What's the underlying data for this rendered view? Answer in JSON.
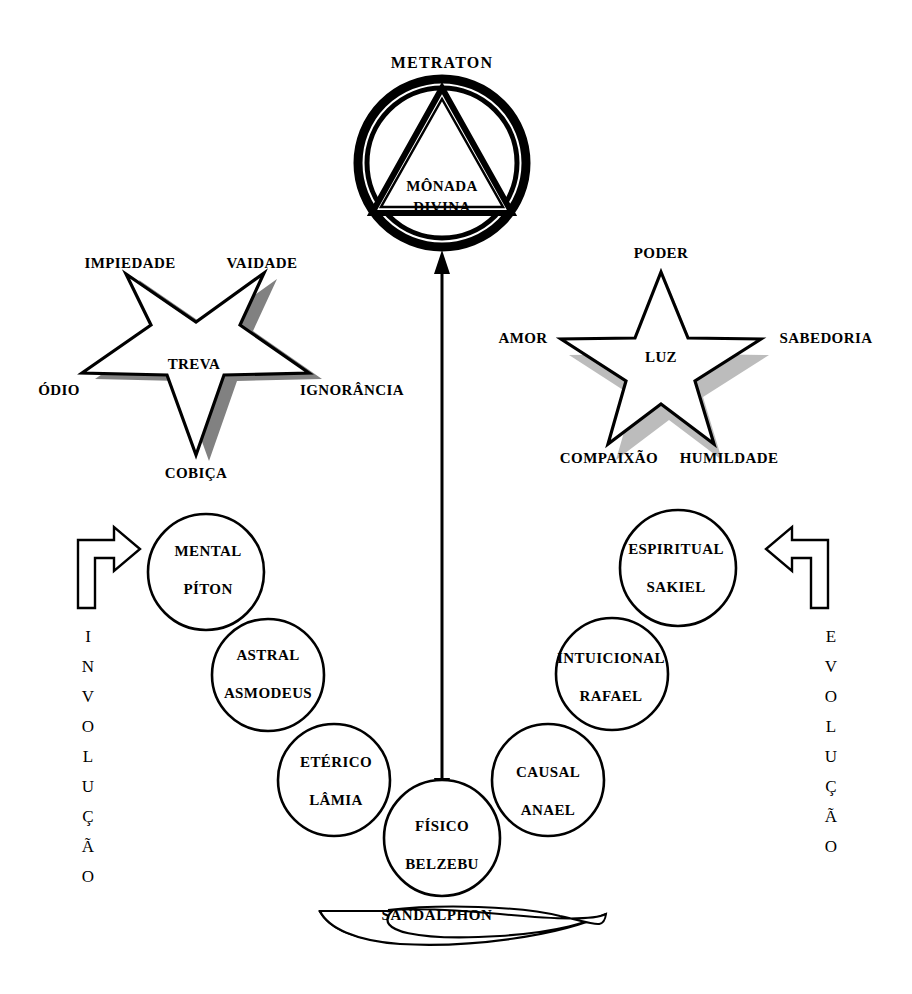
{
  "diagram": {
    "title": "METRATON",
    "top_symbol": {
      "label_above": "METRATON",
      "inner_line1": "MÔNADA",
      "inner_line2": "DIVINA",
      "shape": "double-circle-with-triangle"
    },
    "dark_star": {
      "center_label": "TREVA",
      "orientation": "inverted",
      "points": [
        {
          "name": "impiedade",
          "label": "IMPIEDADE"
        },
        {
          "name": "vaidade",
          "label": "VAIDADE"
        },
        {
          "name": "ignorancia",
          "label": "IGNORÂNCIA"
        },
        {
          "name": "cobica",
          "label": "COBIÇA"
        },
        {
          "name": "odio",
          "label": "ÓDIO"
        }
      ]
    },
    "light_star": {
      "center_label": "LUZ",
      "orientation": "upright",
      "points": [
        {
          "name": "poder",
          "label": "PODER"
        },
        {
          "name": "sabedoria",
          "label": "SABEDORIA"
        },
        {
          "name": "humildade",
          "label": "HUMILDADE"
        },
        {
          "name": "compaixao",
          "label": "COMPAIXÃO"
        },
        {
          "name": "amor",
          "label": "AMOR"
        }
      ]
    },
    "left_chain": {
      "arrow_word": "INVOLUÇÃO",
      "arrow_letters": [
        "I",
        "N",
        "V",
        "O",
        "L",
        "U",
        "Ç",
        "Ã",
        "O"
      ],
      "circles": [
        {
          "plane": "MENTAL",
          "entity": "PÍTON"
        },
        {
          "plane": "ASTRAL",
          "entity": "ASMODEUS"
        },
        {
          "plane": "ETÉRICO",
          "entity": "LÂMIA"
        }
      ]
    },
    "right_chain": {
      "arrow_word": "EVOLUÇÃO",
      "arrow_letters": [
        "E",
        "V",
        "O",
        "L",
        "U",
        "Ç",
        "Ã",
        "O"
      ],
      "circles": [
        {
          "plane": "ESPIRITUAL",
          "entity": "SAKIEL"
        },
        {
          "plane": "INTUICIONAL",
          "entity": "RAFAEL"
        },
        {
          "plane": "CAUSAL",
          "entity": "ANAEL"
        }
      ]
    },
    "center_circle": {
      "plane": "FÍSICO",
      "entity": "BELZEBU"
    },
    "base_label": "SANDALPHON",
    "center_arrow": {
      "name": "vertical-double-arrow",
      "direction": "both"
    },
    "colors": {
      "ink": "#000000",
      "background": "#ffffff",
      "shadow_dark": "#6d6d6d",
      "shadow_light": "#b8b8b8"
    }
  }
}
